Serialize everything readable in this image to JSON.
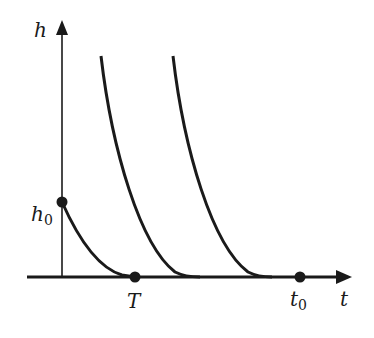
{
  "diagram": {
    "axes": {
      "y_label": "h",
      "x_label": "t"
    },
    "points": {
      "h0": {
        "label": "h",
        "subscript": "0"
      },
      "T": {
        "label": "T"
      },
      "t0": {
        "label": "t",
        "subscript": "0"
      }
    },
    "curves": [
      {
        "name": "curve-from-h0",
        "description": "decreasing curve from h0 reaching zero at T"
      },
      {
        "name": "curve-2",
        "description": "decreasing curve reaching zero before t0"
      },
      {
        "name": "curve-3",
        "description": "decreasing curve reaching zero near t0"
      }
    ],
    "colors": {
      "line": "#1a1a1a",
      "background": "#ffffff"
    }
  }
}
